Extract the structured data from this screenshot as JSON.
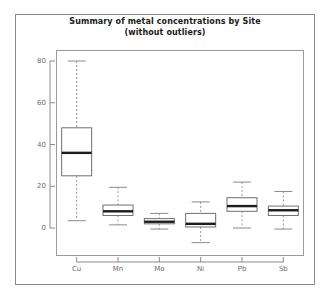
{
  "figure": {
    "width": 331,
    "height": 299,
    "background": "#ffffff",
    "frame_color": "#8a8a8a",
    "panel_color": "#9a9a9a"
  },
  "title": {
    "line1": "Summary of metal concentrations by Site",
    "line2": "(without outliers)"
  },
  "chart_data": {
    "type": "box",
    "title": "Summary of metal concentrations by Site (without outliers)",
    "subtitle": "(without outliers)",
    "xlabel": "",
    "ylabel": "",
    "ylim": [
      -12,
      86
    ],
    "grid": false,
    "legend": null,
    "categories": [
      "Cu",
      "Mn",
      "Mo",
      "Ni",
      "Pb",
      "Sb"
    ],
    "yticks": [
      0,
      20,
      40,
      60,
      80
    ],
    "ytick_labels": [
      "0",
      "20",
      "40",
      "60",
      "80"
    ],
    "boxes": [
      {
        "label": "Cu",
        "whisker_low": 3.5,
        "q1": 25,
        "median": 36,
        "q3": 48,
        "whisker_high": 80
      },
      {
        "label": "Mn",
        "whisker_low": 1.5,
        "q1": 6,
        "median": 8,
        "q3": 11,
        "whisker_high": 19.5
      },
      {
        "label": "Mo",
        "whisker_low": -0.5,
        "q1": 2,
        "median": 3,
        "q3": 4.5,
        "whisker_high": 7
      },
      {
        "label": "Ni",
        "whisker_low": -7,
        "q1": 0.5,
        "median": 2,
        "q3": 7,
        "whisker_high": 12.5
      },
      {
        "label": "Pb",
        "whisker_low": 0,
        "q1": 8,
        "median": 10.5,
        "q3": 14.5,
        "whisker_high": 22
      },
      {
        "label": "Sb",
        "whisker_low": -0.5,
        "q1": 6,
        "median": 8.5,
        "q3": 10.5,
        "whisker_high": 17.5
      }
    ],
    "colors": {
      "box_fill": "#ffffff",
      "box_edge": "#6f6f6f",
      "median": "#1c1c1c",
      "whisker": "#9a9a9a",
      "axis": "#8a8a8a",
      "text": "#6b6b6b",
      "title_text": "#1a1a1a"
    }
  }
}
